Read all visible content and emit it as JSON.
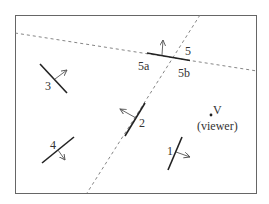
{
  "diagram": {
    "type": "bsp-tree-scene",
    "colors": {
      "frame": "#555555",
      "segment": "#222222",
      "split_line": "#777777",
      "arrow": "#555555",
      "text": "#333333"
    },
    "segments": [
      {
        "id": "1",
        "label": "1"
      },
      {
        "id": "2",
        "label": "2"
      },
      {
        "id": "3",
        "label": "3"
      },
      {
        "id": "4",
        "label": "4"
      },
      {
        "id": "5",
        "label": "5",
        "split_labels": [
          "5a",
          "5b"
        ]
      }
    ],
    "viewer": {
      "label": "V",
      "caption": "(viewer)"
    },
    "split_lines": [
      "through-segment-5",
      "through-segment-2"
    ]
  }
}
